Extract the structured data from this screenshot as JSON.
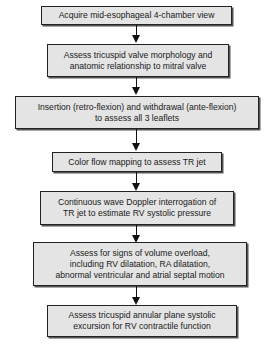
{
  "flowchart": {
    "steps": [
      {
        "lines": [
          "Acquire mid-esophageal 4-chamber view"
        ]
      },
      {
        "lines": [
          "Assess tricuspid valve morphology and",
          "anatomic relationship to mitral valve"
        ]
      },
      {
        "lines": [
          "Insertion (retro-flexion) and withdrawal (ante-flexion)",
          "to assess all 3 leaflets"
        ]
      },
      {
        "lines": [
          "Color flow mapping to assess TR jet"
        ]
      },
      {
        "lines": [
          "Continuous wave Doppler interrogation of",
          "TR jet to estimate RV systolic pressure"
        ]
      },
      {
        "lines": [
          "Assess for signs of volume overload,",
          "including RV dilatation, RA dilatation,",
          "abnormal ventricular and atrial septal motion"
        ]
      },
      {
        "lines": [
          "Assess tricuspid annular plane systolic",
          "excursion for RV contractile function"
        ]
      }
    ],
    "colors": {
      "box_fill": "#e4e4e4",
      "border": "#222222",
      "arrow": "#111111",
      "background": "#ffffff"
    }
  }
}
